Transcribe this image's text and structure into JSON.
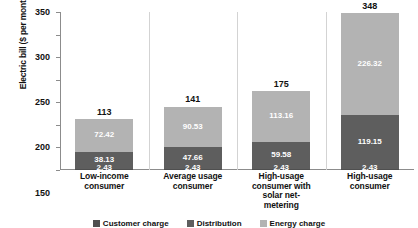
{
  "chart_data": {
    "type": "bar",
    "subtype": "stacked-bar",
    "title": "",
    "xlabel": "",
    "ylabel": "Electric bill ($ per month)",
    "ylim": [
      0,
      350
    ],
    "ytick_labels": [
      "350",
      "300",
      "250",
      "200",
      "150",
      "100",
      "50",
      "-"
    ],
    "yticks": [
      350,
      300,
      250,
      200,
      150,
      100,
      50,
      0
    ],
    "grid": false,
    "legend_position": "bottom",
    "categories": [
      "Low-income consumer",
      "Average usage consumer",
      "High-usage consumer with solar net-metering",
      "High-usage consumer"
    ],
    "series": [
      {
        "name": "Fixed charge",
        "color": "#4f4f4f",
        "values": [
          2.43,
          2.43,
          2.43,
          2.43
        ]
      },
      {
        "name": "Distribution charge",
        "color": "#5e5e5e",
        "values": [
          38.13,
          47.66,
          59.58,
          119.15
        ]
      },
      {
        "name": "Energy charge",
        "color": "#b3b3b3",
        "values": [
          72.42,
          90.53,
          113.16,
          226.32
        ]
      }
    ],
    "totals": [
      113,
      141,
      175,
      348
    ],
    "total_labels": [
      "113",
      "141",
      "175",
      "348"
    ],
    "segment_labels": [
      {
        "base": "2.43",
        "middle": "38.13",
        "top": "72.42"
      },
      {
        "base": "2.43",
        "middle": "47.66",
        "top": "90.53"
      },
      {
        "base": "2.43",
        "middle": "59.58",
        "top": "113.16"
      },
      {
        "base": "2.43",
        "middle": "119.15",
        "top": "226.32"
      }
    ],
    "legend": [
      {
        "label": "Customer charge",
        "color": "#4f4f4f"
      },
      {
        "label": "Distribution",
        "color": "#5e5e5e"
      },
      {
        "label": "Energy charge",
        "color": "#b3b3b3"
      }
    ],
    "colors": {
      "base_segment": "#4f4f4f",
      "middle_segment": "#5e5e5e",
      "top_segment": "#b3b3b3",
      "axis": "#8c8c8c",
      "separator": "#d3d3d3",
      "text": "#111111",
      "segment_text": "#ffffff",
      "background": "#ffffff"
    }
  },
  "category_lines": [
    [
      "Low-income",
      "consumer"
    ],
    [
      "Average usage",
      "consumer"
    ],
    [
      "High-usage",
      "consumer with",
      "solar net-",
      "metering"
    ],
    [
      "High-usage",
      "consumer"
    ]
  ]
}
